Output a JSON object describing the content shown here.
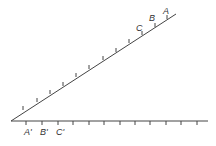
{
  "diagram": {
    "type": "angle-with-marked-rays",
    "vertex": {
      "x": 11,
      "y": 121
    },
    "colors": {
      "line": "#444444",
      "label": "#333333",
      "background": "#ffffff"
    },
    "upper_ray": {
      "end": {
        "x": 176,
        "y": 14
      },
      "ticks": [
        {
          "x": 23,
          "y": 110
        },
        {
          "x": 37,
          "y": 102
        },
        {
          "x": 50,
          "y": 94
        },
        {
          "x": 63,
          "y": 86
        },
        {
          "x": 76,
          "y": 77
        },
        {
          "x": 89,
          "y": 69
        },
        {
          "x": 103,
          "y": 60
        },
        {
          "x": 116,
          "y": 52
        },
        {
          "x": 129,
          "y": 43
        },
        {
          "x": 142,
          "y": 35
        },
        {
          "x": 155,
          "y": 27
        },
        {
          "x": 167,
          "y": 19
        }
      ],
      "labels": [
        {
          "text": "A",
          "x": 163,
          "y": 14
        },
        {
          "text": "B",
          "x": 149,
          "y": 21
        },
        {
          "text": "C",
          "x": 136,
          "y": 31
        }
      ]
    },
    "lower_ray": {
      "end": {
        "x": 208,
        "y": 121
      },
      "ticks": [
        26,
        42,
        58,
        73,
        89,
        104,
        120,
        135,
        150,
        166,
        181,
        197
      ],
      "labels": [
        {
          "text": "A'",
          "x": 24,
          "y": 135
        },
        {
          "text": "B'",
          "x": 40,
          "y": 135
        },
        {
          "text": "C'",
          "x": 56,
          "y": 135
        }
      ]
    }
  }
}
